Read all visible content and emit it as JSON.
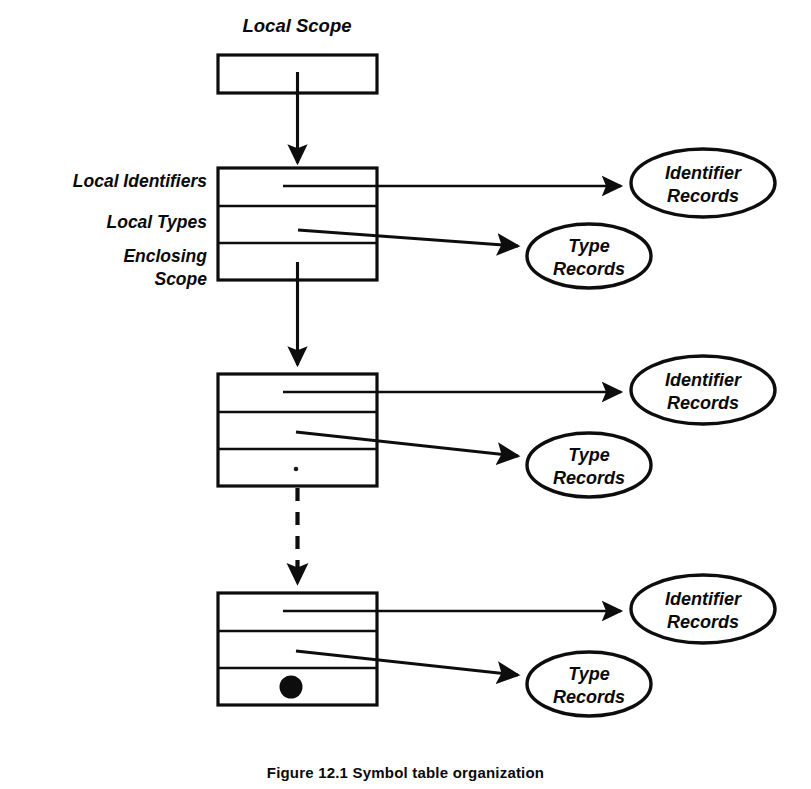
{
  "figure": {
    "title_label": "Local Scope",
    "caption": "Figure 12.1  Symbol table organization",
    "row_labels": [
      "Local Identifiers",
      "Local Types",
      "Enclosing",
      "Scope"
    ],
    "colors": {
      "ink": "#0d0d0d",
      "background": "#ffffff"
    },
    "scope_blocks": [
      {
        "name": "top-stub-block",
        "rows": 1,
        "marker": "none",
        "has_identifier_arrow": false,
        "has_type_arrow": false
      },
      {
        "name": "first-scope-block",
        "rows": 3,
        "marker": "none",
        "has_identifier_arrow": true,
        "has_type_arrow": true
      },
      {
        "name": "second-scope-block",
        "rows": 3,
        "marker": "small-dot",
        "has_identifier_arrow": true,
        "has_type_arrow": true
      },
      {
        "name": "last-scope-block",
        "rows": 3,
        "marker": "nil-dot",
        "has_identifier_arrow": true,
        "has_type_arrow": true
      }
    ],
    "record_nodes": [
      {
        "id": "identifier-records-1",
        "line1": "Identifier",
        "line2": "Records"
      },
      {
        "id": "type-records-1",
        "line1": "Type",
        "line2": "Records"
      },
      {
        "id": "identifier-records-2",
        "line1": "Identifier",
        "line2": "Records"
      },
      {
        "id": "type-records-2",
        "line1": "Type",
        "line2": "Records"
      },
      {
        "id": "identifier-records-3",
        "line1": "Identifier",
        "line2": "Records"
      },
      {
        "id": "type-records-3",
        "line1": "Type",
        "line2": "Records"
      }
    ],
    "links": [
      {
        "from": "top-stub-block",
        "to": "first-scope-block",
        "style": "solid"
      },
      {
        "from": "first-scope-block",
        "to": "second-scope-block",
        "style": "solid"
      },
      {
        "from": "second-scope-block",
        "to": "last-scope-block",
        "style": "dashed"
      }
    ]
  }
}
